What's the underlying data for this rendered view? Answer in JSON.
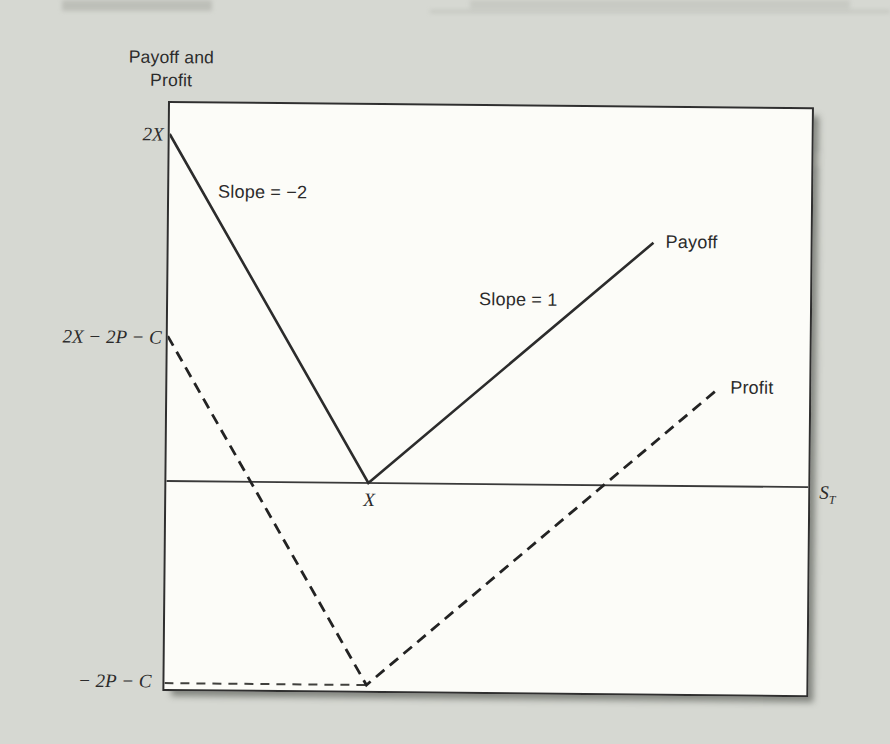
{
  "figure": {
    "axis_title_line1": "Payoff and",
    "axis_title_line2": "Profit",
    "labels": {
      "payoff": "Payoff",
      "profit": "Profit",
      "slope_left": "Slope = −2",
      "slope_right": "Slope = 1",
      "strike_tick": "X",
      "x_axis_var": "S",
      "x_axis_sub": "T",
      "y_top": "2X",
      "y_mid": "2X − 2P − C",
      "y_bottom": "− 2P − C"
    },
    "colors": {
      "page_bg": "#d6d8d2",
      "plot_bg": "#fcfcf8",
      "ink": "#2c2c2c"
    }
  },
  "chart_data": {
    "type": "line",
    "title": "",
    "xlabel": "S_T",
    "ylabel": "Payoff and Profit",
    "units": "axis values expressed in multiples of the strike price X (X = 1)",
    "xlim": [
      0,
      3.18
    ],
    "ylim": [
      -1.35,
      2.19
    ],
    "grid": false,
    "series": [
      {
        "name": "Payoff",
        "style": "solid",
        "points": [
          [
            0,
            2.0
          ],
          [
            1.0,
            0.0
          ],
          [
            2.4,
            1.4
          ]
        ]
      },
      {
        "name": "Profit",
        "style": "dashed",
        "points": [
          [
            0,
            0.835
          ],
          [
            1.0,
            -1.165
          ],
          [
            2.73,
            0.565
          ]
        ]
      }
    ],
    "guide_lines": [
      {
        "name": "x-axis",
        "style": "solid",
        "points": [
          [
            0,
            0
          ],
          [
            3.18,
            0
          ]
        ]
      },
      {
        "name": "level -2P-C",
        "style": "dashed",
        "points": [
          [
            0,
            -1.165
          ],
          [
            1.0,
            -1.165
          ]
        ]
      }
    ],
    "key_points": {
      "payoff_intercept_at_S0": "2X",
      "profit_intercept_at_S0": "2X − 2P − C",
      "kink_location": "S_T = X",
      "minimum_profit": "− 2P − C",
      "left_slope": -2,
      "right_slope": 1
    }
  }
}
